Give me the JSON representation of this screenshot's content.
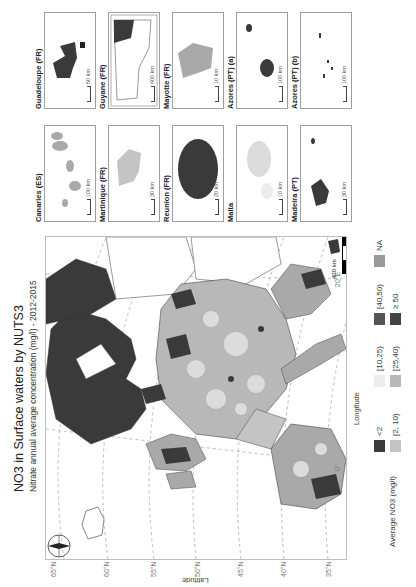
{
  "figure": {
    "title": "NO3 in Surface waters by NUTS3",
    "subtitle": "Nitrate annual average concentration (mg/l) - 2012-2015",
    "orientation": "rotated 90° counter-clockwise"
  },
  "map": {
    "latitude_axis_title": "Latitude",
    "longitude_axis_title": "Longitude",
    "latitude_ticks": [
      "65°N",
      "60°N",
      "55°N",
      "50°N",
      "45°N",
      "40°N",
      "35°N"
    ],
    "longitude_ticks": [
      "0°",
      "20°E"
    ],
    "scalebar_label": "400 km",
    "north_arrow_label": "N"
  },
  "legend": {
    "title": "Average NO3 (mg/l)",
    "items": [
      {
        "label": "<2",
        "color": "#3a3a3a"
      },
      {
        "label": "[2, 10)",
        "color": "#c4c4c4"
      },
      {
        "label": "[10,25)",
        "color": "#ececec"
      },
      {
        "label": "[25,40)",
        "color": "#b8b8b8"
      },
      {
        "label": "[40,50)",
        "color": "#555555"
      },
      {
        "label": "≥ 50",
        "color": "#444444"
      },
      {
        "label": "NA",
        "color": "#9a9a9a"
      }
    ]
  },
  "insets": [
    {
      "name": "Canaries (ES)",
      "scale": "100 km"
    },
    {
      "name": "Guadeloupe (FR)",
      "scale": "50 km"
    },
    {
      "name": "Martinique (FR)",
      "scale": "30 km"
    },
    {
      "name": "Guyane (FR)",
      "scale": "400 km"
    },
    {
      "name": "Reunion (FR)",
      "scale": "20 km"
    },
    {
      "name": "Mayotte (FR)",
      "scale": "10 km"
    },
    {
      "name": "Malta",
      "scale": "10 km"
    },
    {
      "name": "Azores (PT) (a)",
      "scale": "100 km"
    },
    {
      "name": "Madeira (PT)",
      "scale": "30 km"
    },
    {
      "name": "Azores (PT) (b)",
      "scale": "100 km"
    }
  ],
  "colors": {
    "dark": "#3a3a3a",
    "mid": "#a9a9a9",
    "light": "#dcdcdc",
    "grid": "#9e9e9e",
    "frame": "#bdbdbd"
  }
}
